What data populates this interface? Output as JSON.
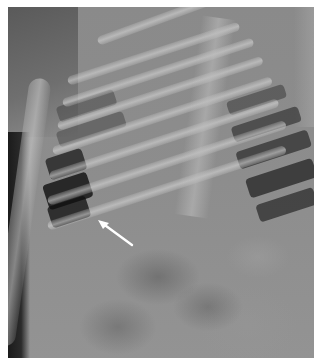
{
  "image": {
    "type": "radiograph",
    "description": "Grayscale X-ray of infant chest and upper abdomen, lateral/oblique view, with white arrow annotation",
    "annotations": [
      {
        "kind": "arrow",
        "color": "#ffffff",
        "direction": "pointing up-left",
        "tip_x": 91,
        "tip_y": 214,
        "tail_x": 115,
        "tail_y": 240
      }
    ],
    "border_color": "#ffffff"
  }
}
